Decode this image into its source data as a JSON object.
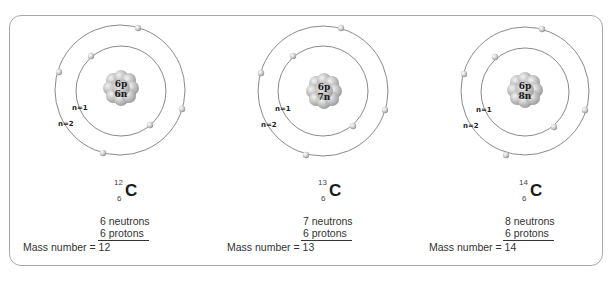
{
  "atoms": [
    {
      "element": "C",
      "mass_number_sup": "12",
      "atomic_number_sub": "6",
      "nucleus_protons": "6p",
      "nucleus_neutrons": "6n",
      "shell_inner_label": "n=1",
      "shell_outer_label": "n=2",
      "neutrons_text": "6 neutrons",
      "protons_text": "6 protons",
      "mass_number_text": "Mass number = 12"
    },
    {
      "element": "C",
      "mass_number_sup": "13",
      "atomic_number_sub": "6",
      "nucleus_protons": "6p",
      "nucleus_neutrons": "7n",
      "shell_inner_label": "n=1",
      "shell_outer_label": "n=2",
      "neutrons_text": "7 neutrons",
      "protons_text": "6 protons",
      "mass_number_text": "Mass number = 13"
    },
    {
      "element": "C",
      "mass_number_sup": "14",
      "atomic_number_sub": "6",
      "nucleus_protons": "6p",
      "nucleus_neutrons": "8n",
      "shell_inner_label": "n=1",
      "shell_outer_label": "n=2",
      "neutrons_text": "8 neutrons",
      "protons_text": "6 protons",
      "mass_number_text": "Mass number = 14"
    }
  ],
  "colors": {
    "frame_border": "#a8a8a8",
    "orbit": "#8a8a8a",
    "electron": "#c8c8c8",
    "nucleus": "#a0a0a0"
  }
}
